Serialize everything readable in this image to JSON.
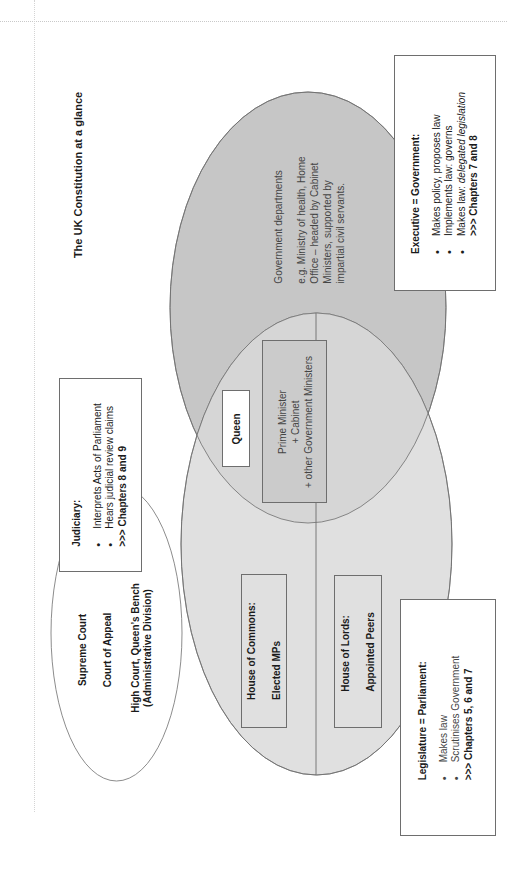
{
  "title": "The UK Constitution at a glance",
  "colors": {
    "executive_fill": "#c6c6c6",
    "legislature_fill": "#e0e0e0",
    "overlap_fill": "#d6d6d6",
    "pm_box_fill": "#cbcbcb",
    "outline": "#6e6e6e"
  },
  "executive": {
    "header": "Executive = Government:",
    "bullets": [
      "Makes policy, proposes law",
      "Implements law: governs",
      "Makes law: "
    ],
    "bullet3_italic": "delegated legislation",
    "chapters": ">>> Chapters 7 and 8",
    "departments_title": "Government departments",
    "departments_line1": "e.g. Ministry of health, Home",
    "departments_line2": "Office – headed by Cabinet",
    "departments_line3": "Ministers, supported by",
    "departments_line4": "impartial civil servants."
  },
  "overlap": {
    "queen": "Queen",
    "pm_line1": "Prime Minister",
    "pm_line2": "+ Cabinet",
    "pm_line3": "+ other Government Ministers"
  },
  "legislature": {
    "header": "Legislature = Parliament:",
    "bullets": [
      "Makes law",
      "Scrutinises Government"
    ],
    "chapters": ">>> Chapters 5, 6 and 7",
    "commons_title": "House of Commons:",
    "commons_members": "Elected MPs",
    "lords_title": "House of Lords:",
    "lords_members": "Appointed Peers"
  },
  "judiciary": {
    "header": "Judiciary:",
    "bullets": [
      "Interprets Acts of Parliament",
      "Hears judicial review claims"
    ],
    "chapters": ">>> Chapters 8 and 9",
    "courts": [
      "Supreme Court",
      "Court of Appeal",
      "High Court, Queen’s Bench",
      "(Administrative Division)"
    ]
  }
}
